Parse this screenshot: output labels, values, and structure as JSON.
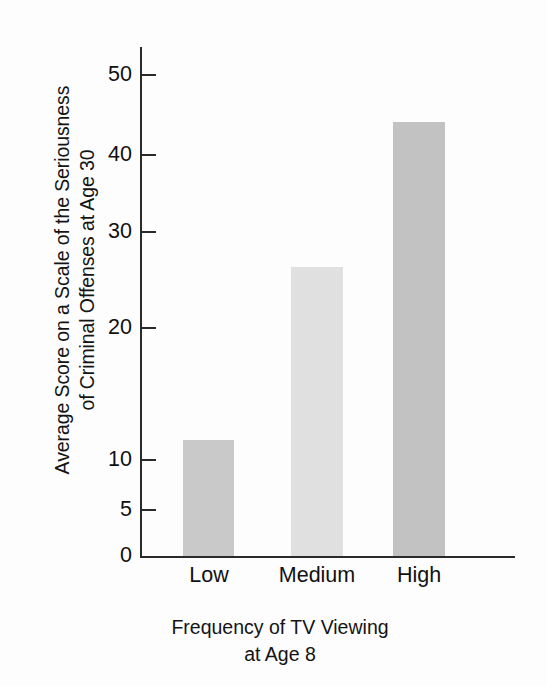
{
  "chart_data": {
    "type": "bar",
    "title": "",
    "categories": [
      "Low",
      "Medium",
      "High"
    ],
    "values": [
      12,
      30,
      45
    ],
    "series": [
      {
        "name": "Average Score on a Scale of the Seriousness of Criminal Offenses at Age 30",
        "values": [
          12,
          30,
          45
        ]
      }
    ],
    "xlabel": "Frequency of TV Viewing at Age 8",
    "xlabel_lines": [
      "Frequency of TV Viewing",
      "at Age 8"
    ],
    "ylabel": "Average Score on a Scale of the Seriousness of Criminal Offenses at Age 30",
    "ylabel_lines": [
      "Average Score on a Scale of the Seriousness",
      "of Criminal Offenses at Age 30"
    ],
    "ylim": [
      0,
      52
    ],
    "yticks": [
      0,
      5,
      10,
      20,
      30,
      40,
      50
    ],
    "ytick_labels": [
      "0",
      "5",
      "10",
      "20",
      "30",
      "40",
      "50"
    ],
    "xticks": [],
    "grid": false,
    "legend": false,
    "legend_position": "none",
    "bar_colors": [
      "#c9c9c9",
      "#e0e0e0",
      "#c2c2c2"
    ],
    "axis_color": "#2a2a2a",
    "background_color": "#fdfdfd",
    "text_color": "#111111"
  },
  "axis": {
    "y_tick_0": "0",
    "y_tick_5": "5",
    "y_tick_10": "10",
    "y_tick_20": "20",
    "y_tick_30": "30",
    "y_tick_40": "40",
    "y_tick_50": "50"
  },
  "labels": {
    "cat_low": "Low",
    "cat_medium": "Medium",
    "cat_high": "High",
    "y_title_line1": "Average Score on a Scale of the Seriousness",
    "y_title_line2": "of Criminal Offenses at Age 30",
    "x_title_line1": "Frequency of TV Viewing",
    "x_title_line2": "at Age 8"
  }
}
